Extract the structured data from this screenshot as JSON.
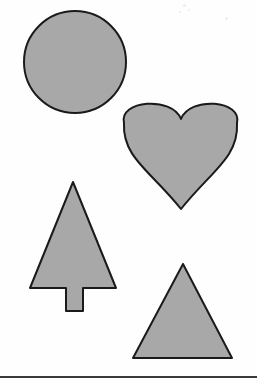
{
  "page": {
    "width": 257,
    "height": 385,
    "background_color": "#fefefe"
  },
  "style": {
    "fill_color": "#a8a8a8",
    "stroke_color": "#1a1a1a",
    "stroke_width": 2,
    "rule_color": "#3a3a3a"
  },
  "shapes": [
    {
      "id": "circle",
      "name": "circle",
      "label": "Circle",
      "center_x": 75,
      "center_y": 62,
      "radius": 51
    },
    {
      "id": "heart",
      "name": "heart",
      "label": "Heart",
      "left": 124,
      "top": 98,
      "right": 237,
      "bottom": 210,
      "notch_x": 181,
      "notch_y": 119,
      "tip_x": 181,
      "tip_y": 209
    },
    {
      "id": "tree",
      "name": "tree",
      "label": "Tree",
      "apex_x": 73,
      "apex_y": 182,
      "canopy_left": 30,
      "canopy_right": 116,
      "canopy_bottom": 288,
      "trunk_left": 66,
      "trunk_right": 83,
      "trunk_bottom": 311
    },
    {
      "id": "triangle",
      "name": "triangle",
      "label": "Triangle",
      "apex_x": 183,
      "apex_y": 264,
      "base_left": 133,
      "base_right": 232,
      "base_y": 358
    }
  ],
  "rule": {
    "name": "bottom-rule",
    "y": 377,
    "x_start": 0,
    "x_end": 257,
    "thickness": 2
  },
  "specks": [
    {
      "x": 183,
      "y": 4,
      "size": 3
    },
    {
      "x": 188,
      "y": 9,
      "size": 2
    },
    {
      "x": 225,
      "y": 17,
      "size": 3
    },
    {
      "x": 179,
      "y": 11,
      "size": 2
    }
  ]
}
